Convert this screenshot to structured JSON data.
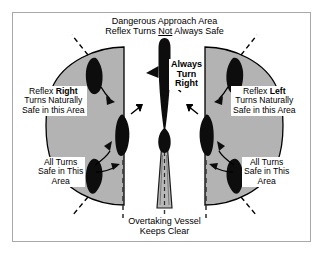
{
  "diagram": {
    "colors": {
      "sector_fill": "#b3b3b3",
      "vessel_fill": "#0d0d0d",
      "wake_fill": "#b8b8b8",
      "outline": "#000000",
      "frame": "#a8a8a8",
      "background": "#ffffff"
    },
    "labels": {
      "top": {
        "line1": "Dangerous Approach Area",
        "line2_pre": "Reflex Turns ",
        "line2_emph": "Not",
        "line2_post": " Always Safe"
      },
      "left_sector": {
        "line1_pre": "Reflex ",
        "line1_emph": "Right",
        "line2": "Turns Naturally",
        "line3": "Safe in this Area"
      },
      "right_sector": {
        "line1_pre": "Reflex ",
        "line1_emph": "Left",
        "line2": "Turns Naturally",
        "line3": "Safe in this Area"
      },
      "left_lower": {
        "line1": "All Turns",
        "line2": "Safe in This",
        "line3": "Area"
      },
      "right_lower": {
        "line1": "All Turns",
        "line2": "Safe in This",
        "line3": "Area"
      },
      "center": {
        "line1": "Always",
        "line2": "Turn",
        "line3": "Right"
      },
      "bottom": {
        "line1": "Overtaking Vessel",
        "line2": "Keeps Clear"
      }
    }
  }
}
